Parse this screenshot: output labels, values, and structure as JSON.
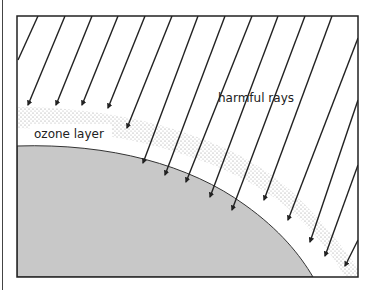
{
  "diagram": {
    "labels": {
      "ozone_layer": "ozone layer",
      "harmful_rays": "harmful rays"
    },
    "colors": {
      "earth": "#c8c8c8",
      "ozone_dots": "#9a9a9a",
      "frame": "#222222",
      "rays": "#222222"
    }
  }
}
